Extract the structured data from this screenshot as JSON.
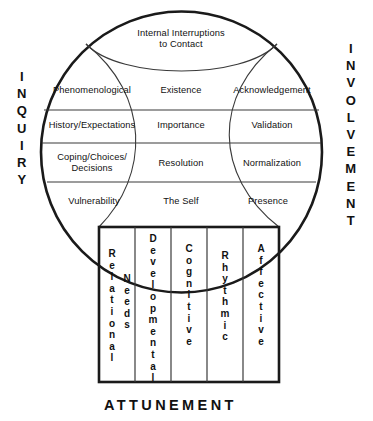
{
  "figure": {
    "title_top": "Internal Interruptions to Contact",
    "title_top_line1": "Internal Interruptions",
    "title_top_line2": "to Contact",
    "left_axis_label": "INQUIRY",
    "right_axis_label": "INVOLVEMENT",
    "bottom_axis_label": "ATTUNEMENT",
    "stroke_color": "#1a1a1a",
    "thin_stroke_color": "#3a3a3a",
    "background_color": "#ffffff",
    "text_color": "#111111"
  },
  "grid": {
    "columns": [
      "Inquiry",
      "Middle",
      "Involvement"
    ],
    "rows": [
      {
        "left": "Phenomenological",
        "middle": "Existence",
        "right": "Acknowledgement"
      },
      {
        "left": "History/Expectations",
        "middle": "Importance",
        "right": "Validation"
      },
      {
        "left_line1": "Coping/Choices/",
        "left_line2": "Decisions",
        "left": "Coping/Choices/ Decisions",
        "middle": "Resolution",
        "right": "Normalization"
      },
      {
        "left": "Vulnerability",
        "middle": "The Self",
        "right": "Presence"
      }
    ]
  },
  "attunement": {
    "label": "ATTUNEMENT",
    "columns": [
      {
        "primary": "Relational",
        "secondary": "Needs"
      },
      {
        "primary": "Developmental",
        "secondary": ""
      },
      {
        "primary": "Cognitive",
        "secondary": ""
      },
      {
        "primary": "Rhythmic",
        "secondary": ""
      },
      {
        "primary": "Affective",
        "secondary": ""
      }
    ]
  }
}
